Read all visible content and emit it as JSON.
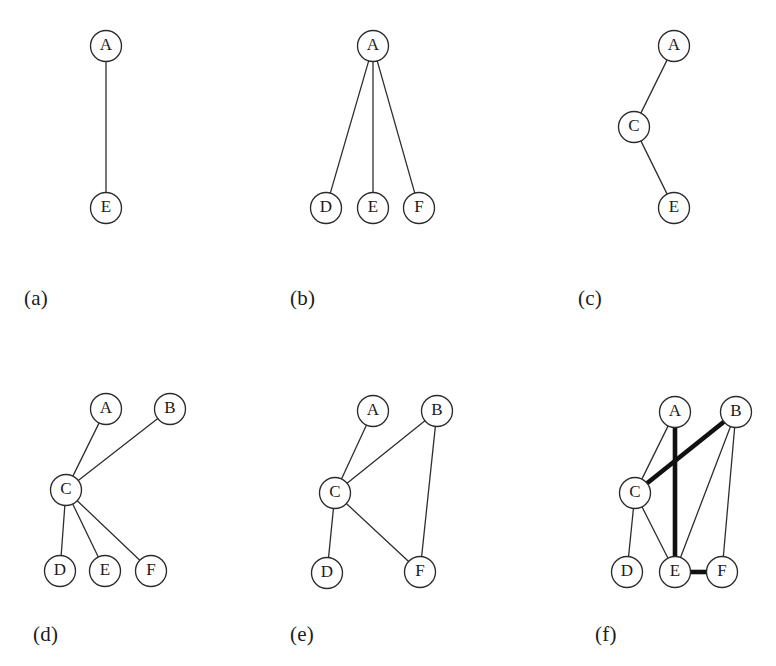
{
  "figure": {
    "width": 776,
    "height": 666,
    "background_color": "#ffffff",
    "node_radius": 15.5,
    "node_fill": "#ffffff",
    "node_stroke": "#2b2b2b",
    "edge_color": "#2e2e2e",
    "thick_edge_color": "#111111",
    "thin_edge_width": 1.3,
    "thick_edge_width": 4.6
  },
  "panels": [
    {
      "id": "panel-a",
      "caption": "(a)",
      "caption_x": 24,
      "caption_y": 286,
      "nodes": [
        {
          "id": "A",
          "label": "A",
          "x": 106,
          "y": 46
        },
        {
          "id": "E",
          "label": "E",
          "x": 106,
          "y": 208
        }
      ],
      "edges": [
        {
          "from": "A",
          "to": "E",
          "weight": "thin"
        }
      ]
    },
    {
      "id": "panel-b",
      "caption": "(b)",
      "caption_x": 290,
      "caption_y": 286,
      "nodes": [
        {
          "id": "A",
          "label": "A",
          "x": 373,
          "y": 46
        },
        {
          "id": "D",
          "label": "D",
          "x": 326,
          "y": 208
        },
        {
          "id": "E",
          "label": "E",
          "x": 373,
          "y": 208
        },
        {
          "id": "F",
          "label": "F",
          "x": 419,
          "y": 208
        }
      ],
      "edges": [
        {
          "from": "A",
          "to": "D",
          "weight": "thin"
        },
        {
          "from": "A",
          "to": "E",
          "weight": "thin"
        },
        {
          "from": "A",
          "to": "F",
          "weight": "thin"
        }
      ]
    },
    {
      "id": "panel-c",
      "caption": "(c)",
      "caption_x": 578,
      "caption_y": 286,
      "nodes": [
        {
          "id": "A",
          "label": "A",
          "x": 674,
          "y": 46
        },
        {
          "id": "C",
          "label": "C",
          "x": 634,
          "y": 127
        },
        {
          "id": "E",
          "label": "E",
          "x": 674,
          "y": 208
        }
      ],
      "edges": [
        {
          "from": "A",
          "to": "C",
          "weight": "thin"
        },
        {
          "from": "C",
          "to": "E",
          "weight": "thin"
        }
      ]
    },
    {
      "id": "panel-d",
      "caption": "(d)",
      "caption_x": 33,
      "caption_y": 622,
      "nodes": [
        {
          "id": "A",
          "label": "A",
          "x": 106,
          "y": 409
        },
        {
          "id": "B",
          "label": "B",
          "x": 170,
          "y": 409
        },
        {
          "id": "C",
          "label": "C",
          "x": 66,
          "y": 490
        },
        {
          "id": "D",
          "label": "D",
          "x": 60,
          "y": 571
        },
        {
          "id": "E",
          "label": "E",
          "x": 105,
          "y": 571
        },
        {
          "id": "F",
          "label": "F",
          "x": 151,
          "y": 571
        }
      ],
      "edges": [
        {
          "from": "A",
          "to": "C",
          "weight": "thin"
        },
        {
          "from": "B",
          "to": "C",
          "weight": "thin"
        },
        {
          "from": "C",
          "to": "D",
          "weight": "thin"
        },
        {
          "from": "C",
          "to": "E",
          "weight": "thin"
        },
        {
          "from": "C",
          "to": "F",
          "weight": "thin"
        }
      ]
    },
    {
      "id": "panel-e",
      "caption": "(e)",
      "caption_x": 290,
      "caption_y": 622,
      "nodes": [
        {
          "id": "A",
          "label": "A",
          "x": 373,
          "y": 411
        },
        {
          "id": "B",
          "label": "B",
          "x": 437,
          "y": 411
        },
        {
          "id": "C",
          "label": "C",
          "x": 335,
          "y": 493
        },
        {
          "id": "D",
          "label": "D",
          "x": 327,
          "y": 573
        },
        {
          "id": "F",
          "label": "F",
          "x": 420,
          "y": 572
        }
      ],
      "edges": [
        {
          "from": "A",
          "to": "C",
          "weight": "thin"
        },
        {
          "from": "B",
          "to": "C",
          "weight": "thin"
        },
        {
          "from": "B",
          "to": "F",
          "weight": "thin"
        },
        {
          "from": "C",
          "to": "D",
          "weight": "thin"
        },
        {
          "from": "C",
          "to": "F",
          "weight": "thin"
        }
      ]
    },
    {
      "id": "panel-f",
      "caption": "(f)",
      "caption_x": 595,
      "caption_y": 622,
      "nodes": [
        {
          "id": "A",
          "label": "A",
          "x": 675,
          "y": 412
        },
        {
          "id": "B",
          "label": "B",
          "x": 736,
          "y": 412
        },
        {
          "id": "C",
          "label": "C",
          "x": 635,
          "y": 493
        },
        {
          "id": "D",
          "label": "D",
          "x": 627,
          "y": 572
        },
        {
          "id": "E",
          "label": "E",
          "x": 675,
          "y": 572
        },
        {
          "id": "F",
          "label": "F",
          "x": 722,
          "y": 572
        }
      ],
      "edges": [
        {
          "from": "A",
          "to": "C",
          "weight": "thin"
        },
        {
          "from": "A",
          "to": "E",
          "weight": "thick"
        },
        {
          "from": "B",
          "to": "C",
          "weight": "thick"
        },
        {
          "from": "B",
          "to": "E",
          "weight": "thin"
        },
        {
          "from": "B",
          "to": "F",
          "weight": "thin"
        },
        {
          "from": "C",
          "to": "D",
          "weight": "thin"
        },
        {
          "from": "C",
          "to": "E",
          "weight": "thin"
        },
        {
          "from": "E",
          "to": "F",
          "weight": "thick"
        }
      ]
    }
  ]
}
